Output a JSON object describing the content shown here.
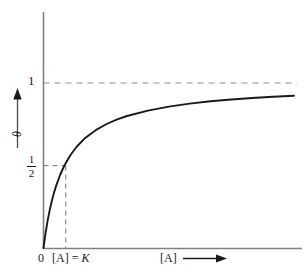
{
  "figure": {
    "kind": "binding-saturation-curve",
    "background_color": "#ffffff",
    "ink_color": "#1a1a1a",
    "axis_color": "#808080",
    "guide_color": "#8c8c8c"
  },
  "labels": {
    "y_tick_one": "1",
    "y_tick_half_numerator": "1",
    "y_tick_half_denominator": "2",
    "y_axis_title": "θ",
    "x_tick_zero": "0",
    "x_tick_k_prefix": "[A] = ",
    "x_tick_k_symbol": "K",
    "x_axis_title": "[A]",
    "x_axis_arrow": "arrow-right-icon",
    "y_axis_arrow": "arrow-up-icon"
  },
  "chart_data": {
    "type": "line",
    "title": "",
    "xlabel": "[A]",
    "ylabel": "θ",
    "grid": false,
    "legend": null,
    "equation": "theta = [A] / (K + [A])",
    "xlim": [
      0,
      12
    ],
    "ylim": [
      0,
      1.18
    ],
    "x_tick_labels": [
      "0",
      "[A] = K"
    ],
    "x_tick_values": [
      0,
      1
    ],
    "y_tick_labels": [
      "1/2",
      "1"
    ],
    "y_tick_values": [
      0.5,
      1
    ],
    "annotations": [
      {
        "name": "asymptote-line",
        "type": "dashed-horizontal",
        "y": 1,
        "x_from": 0,
        "x_to": 12
      },
      {
        "name": "half-saturation-horizontal",
        "type": "dashed-horizontal",
        "y": 0.5,
        "x_from": 0,
        "x_to": 1
      },
      {
        "name": "half-saturation-vertical",
        "type": "dashed-vertical",
        "x": 1,
        "y_from": 0,
        "y_to": 0.5
      }
    ],
    "series": [
      {
        "name": "θ vs [A]",
        "x": [
          0,
          0.1,
          0.2,
          0.3,
          0.4,
          0.5,
          0.6,
          0.8,
          1.0,
          1.3,
          1.6,
          2.0,
          2.5,
          3.0,
          3.5,
          4.0,
          5.0,
          6.0,
          7.0,
          8.0,
          9.0,
          10.0,
          11.0,
          12.0
        ],
        "y": [
          0.0,
          0.091,
          0.167,
          0.231,
          0.286,
          0.333,
          0.375,
          0.444,
          0.5,
          0.565,
          0.615,
          0.667,
          0.714,
          0.75,
          0.778,
          0.8,
          0.833,
          0.857,
          0.875,
          0.889,
          0.9,
          0.909,
          0.917,
          0.923
        ]
      }
    ]
  }
}
